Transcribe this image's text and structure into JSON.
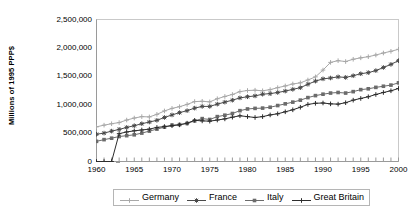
{
  "chart_data": {
    "type": "line",
    "title": "",
    "subtitle": "",
    "xlabel": "",
    "ylabel": "Millions of 1995 PPP$",
    "xlim": [
      1960,
      2000
    ],
    "ylim": [
      0,
      2500000
    ],
    "ytick_labels": [
      "2,500,000",
      "2,000,000",
      "1,500,000",
      "1,000,000",
      "500,000",
      "0"
    ],
    "ytick_values": [
      2500000,
      2000000,
      1500000,
      1000000,
      500000,
      0
    ],
    "xtick_labels": [
      "1960",
      "1965",
      "1970",
      "1975",
      "1980",
      "1985",
      "1990",
      "1995",
      "2000"
    ],
    "xtick_values": [
      1960,
      1965,
      1970,
      1975,
      1980,
      1985,
      1990,
      1995,
      2000
    ],
    "minor_xticks": "every year",
    "grid": false,
    "legend_position": "bottom-center",
    "x": [
      1960,
      1961,
      1962,
      1963,
      1964,
      1965,
      1966,
      1967,
      1968,
      1969,
      1970,
      1971,
      1972,
      1973,
      1974,
      1975,
      1976,
      1977,
      1978,
      1979,
      1980,
      1981,
      1982,
      1983,
      1984,
      1985,
      1986,
      1987,
      1988,
      1989,
      1990,
      1991,
      1992,
      1993,
      1994,
      1995,
      1996,
      1997,
      1998,
      1999,
      2000
    ],
    "series": [
      {
        "name": "Germany",
        "color": "#a8a8a8",
        "marker": "plus",
        "values": [
          610000,
          640000,
          665000,
          685000,
          730000,
          765000,
          790000,
          785000,
          830000,
          890000,
          935000,
          965000,
          1005000,
          1055000,
          1060000,
          1050000,
          1105000,
          1145000,
          1180000,
          1230000,
          1250000,
          1255000,
          1245000,
          1265000,
          1300000,
          1330000,
          1365000,
          1385000,
          1435000,
          1490000,
          1610000,
          1745000,
          1775000,
          1760000,
          1800000,
          1825000,
          1845000,
          1875000,
          1910000,
          1940000,
          1975000
        ]
      },
      {
        "name": "France",
        "color": "#4a4a4a",
        "marker": "cross",
        "values": [
          480000,
          500000,
          535000,
          565000,
          600000,
          630000,
          665000,
          695000,
          725000,
          775000,
          820000,
          860000,
          895000,
          940000,
          970000,
          970000,
          1010000,
          1045000,
          1080000,
          1120000,
          1140000,
          1155000,
          1185000,
          1195000,
          1215000,
          1240000,
          1270000,
          1300000,
          1360000,
          1415000,
          1455000,
          1470000,
          1490000,
          1480000,
          1510000,
          1545000,
          1565000,
          1600000,
          1655000,
          1710000,
          1775000
        ]
      },
      {
        "name": "Italy",
        "color": "#6b6b6b",
        "marker": "square",
        "values": [
          355000,
          385000,
          410000,
          440000,
          455000,
          470000,
          500000,
          535000,
          570000,
          605000,
          640000,
          650000,
          670000,
          715000,
          755000,
          740000,
          790000,
          815000,
          845000,
          895000,
          925000,
          935000,
          940000,
          955000,
          985000,
          1015000,
          1045000,
          1080000,
          1125000,
          1160000,
          1185000,
          1205000,
          1215000,
          1205000,
          1230000,
          1265000,
          1280000,
          1305000,
          1325000,
          1345000,
          1385000
        ]
      },
      {
        "name": "Great Britain",
        "color": "#2d2d2d",
        "marker": "plus",
        "values": [
          0,
          0,
          0,
          490000,
          520000,
          540000,
          555000,
          570000,
          600000,
          615000,
          630000,
          645000,
          675000,
          725000,
          715000,
          710000,
          730000,
          750000,
          780000,
          805000,
          790000,
          775000,
          790000,
          820000,
          840000,
          875000,
          910000,
          955000,
          1005000,
          1025000,
          1030000,
          1015000,
          1010000,
          1035000,
          1080000,
          1110000,
          1140000,
          1180000,
          1215000,
          1245000,
          1285000
        ]
      }
    ],
    "annotations": [
      "Great Britain series reads zero for 1960-1962 before data begins",
      "Germany shows a step increase around 1990-1991 (reunification)"
    ]
  },
  "legend": {
    "entries": [
      {
        "label": "Germany"
      },
      {
        "label": "France"
      },
      {
        "label": "Italy"
      },
      {
        "label": "Great Britain"
      }
    ]
  }
}
